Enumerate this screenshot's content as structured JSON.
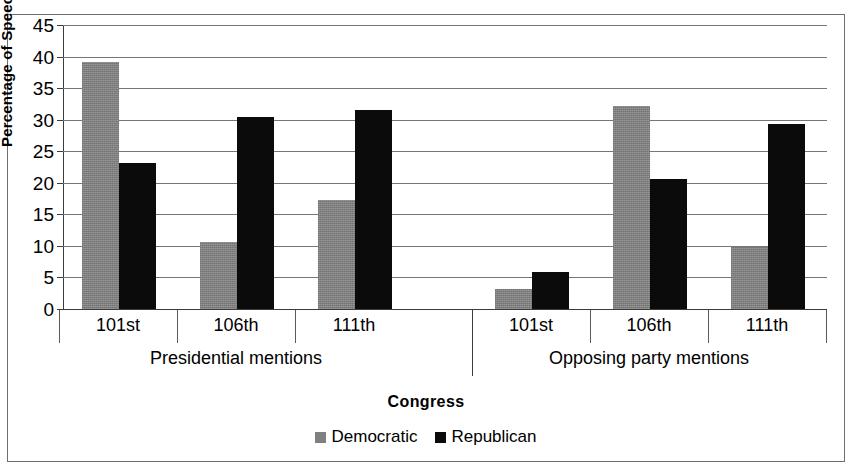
{
  "chart_data": {
    "type": "bar",
    "title": "",
    "xlabel": "Congress",
    "ylabel": "Percentage of Speeches",
    "ylim": [
      0,
      45
    ],
    "ytick_step": 5,
    "yticks": [
      45,
      40,
      35,
      30,
      25,
      20,
      15,
      10,
      5,
      0
    ],
    "grid": true,
    "legend_position": "bottom",
    "categories": [
      "101st",
      "106th",
      "111th",
      "101st",
      "106th",
      "111th"
    ],
    "group_labels": [
      "Presidential mentions",
      "Opposing party mentions"
    ],
    "groups": [
      {
        "label": "Presidential mentions",
        "categories": [
          "101st",
          "106th",
          "111th"
        ],
        "Democratic": [
          39.2,
          10.6,
          17.2
        ],
        "Republican": [
          23.1,
          30.4,
          31.5
        ]
      },
      {
        "label": "Opposing party mentions",
        "categories": [
          "101st",
          "106th",
          "111th"
        ],
        "Democratic": [
          3.2,
          32.1,
          9.8
        ],
        "Republican": [
          5.8,
          20.6,
          29.3
        ]
      }
    ],
    "series": [
      {
        "name": "Democratic",
        "color": "#808080",
        "values": [
          39.2,
          10.6,
          17.2,
          3.2,
          32.1,
          9.8
        ]
      },
      {
        "name": "Republican",
        "color": "#0b0b0b",
        "values": [
          23.1,
          30.4,
          31.5,
          5.8,
          20.6,
          29.3
        ]
      }
    ]
  },
  "legend": {
    "items": [
      {
        "label": "Democratic",
        "color": "#808080"
      },
      {
        "label": "Republican",
        "color": "#0b0b0b"
      }
    ]
  },
  "axes": {
    "y_title": "Percentage of Speeches",
    "x_title": "Congress"
  }
}
